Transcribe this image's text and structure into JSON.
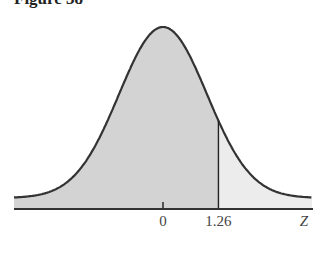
{
  "figure": {
    "title": "Figure 38"
  },
  "chart_data": {
    "type": "area",
    "title": "Figure 38",
    "xlabel": "Z",
    "ylabel": "",
    "x_ticks": [
      {
        "value": 0,
        "label": "0"
      },
      {
        "value": 1.26,
        "label": "1.26"
      }
    ],
    "xlim": [
      -3.5,
      3.5
    ],
    "cutoff": 1.26,
    "regions": [
      {
        "name": "left-area",
        "from": -3.5,
        "to": 1.26,
        "fill": "#d3d3d3"
      },
      {
        "name": "right-tail",
        "from": 1.26,
        "to": 3.5,
        "fill": "#ececec"
      }
    ],
    "grid": false,
    "legend": null
  },
  "colors": {
    "curve": "#333333",
    "dark_fill": "#d3d3d3",
    "light_fill": "#ececec",
    "axis": "#333333"
  }
}
